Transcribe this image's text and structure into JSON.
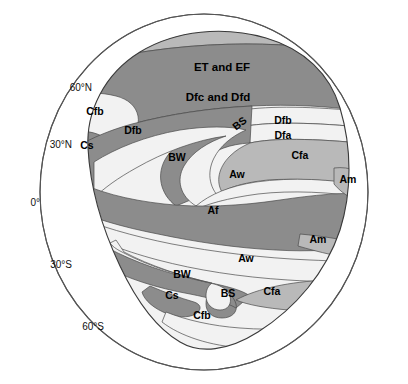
{
  "figure": {
    "kind": "idealized-continent-climate-map",
    "width": 408,
    "height": 384
  },
  "colors": {
    "background": "#ffffff",
    "ocean": "#e9e9e9",
    "outline": "#555555",
    "land_outline": "#3a3a3a",
    "light": "#f2f2f2",
    "pale": "#dcdcdc",
    "mid": "#b9b9b9",
    "dark": "#8c8c8c",
    "darkest": "#7b7b7b",
    "grid": "#ffffff",
    "text": "#000000"
  },
  "latitude_labels": [
    {
      "id": "lat-60n",
      "text": "60°N",
      "x": 92,
      "y": 88
    },
    {
      "id": "lat-30n",
      "text": "30°N",
      "x": 72,
      "y": 145
    },
    {
      "id": "lat-0",
      "text": "0°",
      "x": 40,
      "y": 203
    },
    {
      "id": "lat-30s",
      "text": "30°S",
      "x": 72,
      "y": 265
    },
    {
      "id": "lat-60s",
      "text": "60°S",
      "x": 104,
      "y": 327
    }
  ],
  "gridlines": [
    {
      "id": "grid-60n",
      "y": 88
    },
    {
      "id": "grid-30n",
      "y": 145
    },
    {
      "id": "grid-0",
      "y": 203
    },
    {
      "id": "grid-30s",
      "y": 265
    },
    {
      "id": "grid-60s",
      "y": 327
    }
  ],
  "zones": [
    {
      "id": "et-ef",
      "label": "ET and EF",
      "x": 222,
      "y": 68,
      "rotate": 0,
      "size": "big",
      "shade": "mid"
    },
    {
      "id": "dfc-dfd",
      "label": "Dfc and Dfd",
      "x": 218,
      "y": 98,
      "rotate": 0,
      "size": "big",
      "shade": "dark"
    },
    {
      "id": "cfb-north",
      "label": "Cfb",
      "x": 95,
      "y": 112,
      "rotate": 0,
      "size": "small",
      "shade": "light"
    },
    {
      "id": "dfb-north",
      "label": "Dfb",
      "x": 133,
      "y": 131,
      "rotate": 0,
      "size": "small",
      "shade": "light"
    },
    {
      "id": "cs-north",
      "label": "Cs",
      "x": 87,
      "y": 146,
      "rotate": 0,
      "size": "small",
      "shade": "dark"
    },
    {
      "id": "bs-north",
      "label": "BS",
      "x": 240,
      "y": 124,
      "rotate": -38,
      "size": "small",
      "shade": "dark"
    },
    {
      "id": "dfb-east",
      "label": "Dfb",
      "x": 283,
      "y": 121,
      "rotate": 0,
      "size": "small",
      "shade": "light"
    },
    {
      "id": "dfa-east",
      "label": "Dfa",
      "x": 283,
      "y": 136,
      "rotate": 0,
      "size": "small",
      "shade": "light"
    },
    {
      "id": "bw-north",
      "label": "BW",
      "x": 177,
      "y": 158,
      "rotate": 0,
      "size": "small",
      "shade": "light"
    },
    {
      "id": "cfa-north",
      "label": "Cfa",
      "x": 300,
      "y": 156,
      "rotate": 0,
      "size": "small",
      "shade": "mid"
    },
    {
      "id": "aw-north",
      "label": "Aw",
      "x": 237,
      "y": 175,
      "rotate": 0,
      "size": "small",
      "shade": "light"
    },
    {
      "id": "am-north",
      "label": "Am",
      "x": 348,
      "y": 180,
      "rotate": 0,
      "size": "small",
      "shade": "mid"
    },
    {
      "id": "af",
      "label": "Af",
      "x": 213,
      "y": 211,
      "rotate": 0,
      "size": "small",
      "shade": "dark"
    },
    {
      "id": "am-south",
      "label": "Am",
      "x": 318,
      "y": 240,
      "rotate": 0,
      "size": "small",
      "shade": "mid"
    },
    {
      "id": "aw-south",
      "label": "Aw",
      "x": 246,
      "y": 259,
      "rotate": 0,
      "size": "small",
      "shade": "light"
    },
    {
      "id": "bw-south",
      "label": "BW",
      "x": 182,
      "y": 275,
      "rotate": 0,
      "size": "small",
      "shade": "light"
    },
    {
      "id": "bs-south",
      "label": "BS",
      "x": 228,
      "y": 294,
      "rotate": 0,
      "size": "small",
      "shade": "dark"
    },
    {
      "id": "cfa-south",
      "label": "Cfa",
      "x": 272,
      "y": 292,
      "rotate": 0,
      "size": "small",
      "shade": "mid"
    },
    {
      "id": "cs-south",
      "label": "Cs",
      "x": 172,
      "y": 296,
      "rotate": 0,
      "size": "small",
      "shade": "dark"
    },
    {
      "id": "cfb-south",
      "label": "Cfb",
      "x": 202,
      "y": 316,
      "rotate": 0,
      "size": "small",
      "shade": "light"
    }
  ]
}
